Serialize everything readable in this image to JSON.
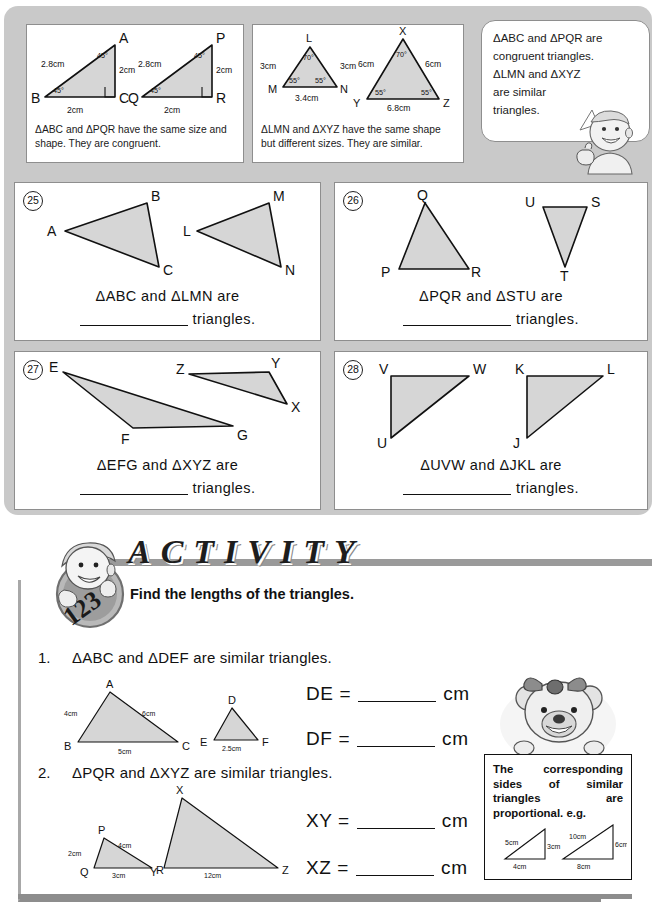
{
  "examples": {
    "box1": {
      "caption": "ΔABC and ΔPQR have the same size and shape.  They are congruent.",
      "triangles": [
        {
          "name": "ABC",
          "vertices": [
            "A",
            "B",
            "C"
          ],
          "sides": [
            "2.8cm",
            "2cm",
            "2cm"
          ],
          "angles": [
            "45°",
            "45°"
          ]
        },
        {
          "name": "PQR",
          "vertices": [
            "P",
            "Q",
            "R"
          ],
          "sides": [
            "2.8cm",
            "2cm",
            "2cm"
          ],
          "angles": [
            "45°",
            "45°"
          ]
        }
      ]
    },
    "box2": {
      "caption": "ΔLMN and ΔXYZ have the same shape but different sizes.  They are similar.",
      "triangles": [
        {
          "name": "LMN",
          "vertices": [
            "L",
            "M",
            "N"
          ],
          "sides": [
            "3cm",
            "3cm",
            "3.4cm"
          ],
          "angles": [
            "70°",
            "55°",
            "55°"
          ]
        },
        {
          "name": "XYZ",
          "vertices": [
            "X",
            "Y",
            "Z"
          ],
          "sides": [
            "6cm",
            "6cm",
            "6.8cm"
          ],
          "angles": [
            "70°",
            "55°",
            "55°"
          ]
        }
      ]
    },
    "bubble": {
      "line1": "ΔABC and ΔPQR are",
      "line2": "congruent triangles.",
      "line3": "ΔLMN and ΔXYZ",
      "line4": "are similar",
      "line5": "triangles."
    }
  },
  "questions": [
    {
      "number": "25",
      "labels_left": [
        "A",
        "B",
        "C"
      ],
      "labels_right": [
        "L",
        "M",
        "N"
      ],
      "prompt": "ΔABC  and  ΔLMN  are",
      "suffix": "triangles."
    },
    {
      "number": "26",
      "labels_left": [
        "P",
        "Q",
        "R"
      ],
      "labels_right": [
        "S",
        "T",
        "U"
      ],
      "prompt": "ΔPQR  and  ΔSTU are",
      "suffix": "triangles."
    },
    {
      "number": "27",
      "labels_left": [
        "E",
        "F",
        "G"
      ],
      "labels_right": [
        "X",
        "Y",
        "Z"
      ],
      "prompt": "ΔEFG  and  ΔXYZ are",
      "suffix": "triangles."
    },
    {
      "number": "28",
      "labels_left": [
        "U",
        "V",
        "W"
      ],
      "labels_right": [
        "J",
        "K",
        "L"
      ],
      "prompt": "ΔUVW  and  ΔJKL are",
      "suffix": "triangles."
    }
  ],
  "activity": {
    "title": "ACTIVITY",
    "instruction": "Find the lengths of the triangles.",
    "items": [
      {
        "number": "1.",
        "statement": "ΔABC  and  ΔDEF are similar triangles.",
        "big_triangle": {
          "vertices": [
            "A",
            "B",
            "C"
          ],
          "sides": [
            "4cm",
            "6cm",
            "5cm"
          ]
        },
        "small_triangle": {
          "vertices": [
            "D",
            "E",
            "F"
          ],
          "sides": [
            "2.5cm"
          ]
        },
        "answers": [
          {
            "label": "DE =",
            "unit": "cm"
          },
          {
            "label": "DF =",
            "unit": "cm"
          }
        ]
      },
      {
        "number": "2.",
        "statement": "ΔPQR  and  ΔXYZ are similar triangles.",
        "small_triangle": {
          "vertices": [
            "P",
            "Q",
            "R"
          ],
          "sides": [
            "2cm",
            "4cm",
            "3cm"
          ]
        },
        "big_triangle": {
          "vertices": [
            "X",
            "Y",
            "Z"
          ],
          "sides": [
            "12cm"
          ]
        },
        "answers": [
          {
            "label": "XY =",
            "unit": "cm"
          },
          {
            "label": "XZ =",
            "unit": "cm"
          }
        ]
      }
    ],
    "note": {
      "text": "The corresponding sides of similar triangles are proportional. e.g.",
      "fig_small": {
        "sides": [
          "5cm",
          "3cm",
          "4cm"
        ]
      },
      "fig_big": {
        "sides": [
          "10cm",
          "6cm",
          "8cm"
        ]
      }
    }
  },
  "colors": {
    "panel_bg": "#c9c9c9",
    "card_bg": "#ffffff",
    "triangle_fill": "#d6d6d6",
    "ink": "#111111",
    "rule": "#8d8d8d"
  }
}
